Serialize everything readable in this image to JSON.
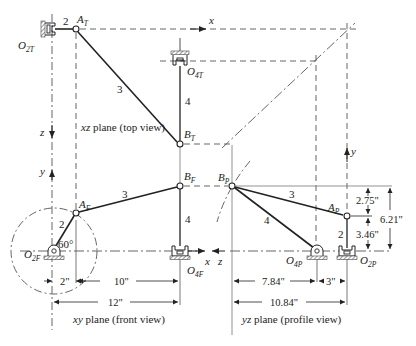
{
  "figure": {
    "views": {
      "top": {
        "caption_italic": "xz",
        "caption_rest": " plane (top view)"
      },
      "front": {
        "caption_italic": "xy",
        "caption_rest": " plane (front view)"
      },
      "profile": {
        "caption_italic": "yz",
        "caption_rest": " plane (profile view)"
      }
    },
    "axes": {
      "x_top": "x",
      "z_top": "z",
      "y_front": "y",
      "x_front": "x",
      "z_profile": "z",
      "y_profile": "y"
    },
    "points": {
      "O2T": {
        "main": "O",
        "sub": "2T"
      },
      "AT": {
        "main": "A",
        "sub": "T"
      },
      "O4T": {
        "main": "O",
        "sub": "4T"
      },
      "BT": {
        "main": "B",
        "sub": "T"
      },
      "AF": {
        "main": "A",
        "sub": "F"
      },
      "BF": {
        "main": "B",
        "sub": "F"
      },
      "O2F": {
        "main": "O",
        "sub": "2F"
      },
      "O4F": {
        "main": "O",
        "sub": "4F"
      },
      "BP": {
        "main": "B",
        "sub": "P"
      },
      "AP": {
        "main": "A",
        "sub": "P"
      },
      "O4P": {
        "main": "O",
        "sub": "4P"
      },
      "O2P": {
        "main": "O",
        "sub": "2P"
      }
    },
    "links": {
      "top_2": "2",
      "top_3": "3",
      "top_4": "4",
      "front_2": "2",
      "front_3": "3",
      "front_4": "4",
      "profile_2": "2",
      "profile_3": "3",
      "profile_4": "4"
    },
    "angle": "60°",
    "dimensions": {
      "front_2in": "2\"",
      "front_10in": "10\"",
      "front_12in": "12\"",
      "profile_7_84in": "7.84\"",
      "profile_3in": "3\"",
      "profile_10_84in": "10.84\"",
      "profile_2_75in": "2.75\"",
      "profile_3_46in": "3.46\"",
      "profile_6_21in": "6.21\""
    }
  }
}
